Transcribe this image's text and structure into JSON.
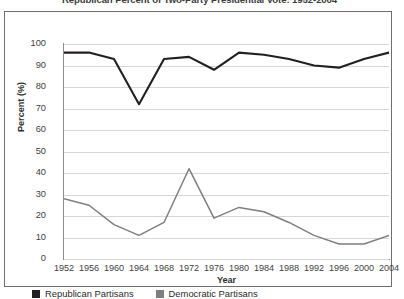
{
  "chart_data": {
    "type": "line",
    "title": "Republican Percent of Two-Party Presidential Vote: 1952-2004",
    "xlabel": "Year",
    "ylabel": "Percent (%)",
    "categories": [
      "1952",
      "1956",
      "1960",
      "1964",
      "1968",
      "1972",
      "1976",
      "1980",
      "1984",
      "1988",
      "1992",
      "1996",
      "2000",
      "2004"
    ],
    "x": [
      1952,
      1956,
      1960,
      1964,
      1968,
      1972,
      1976,
      1980,
      1984,
      1988,
      1992,
      1996,
      2000,
      2004
    ],
    "xlim": [
      1952,
      2004
    ],
    "ylim": [
      0,
      100
    ],
    "yticks": [
      0,
      10,
      20,
      30,
      40,
      50,
      60,
      70,
      80,
      90,
      100
    ],
    "grid": "horizontal",
    "legend_position": "below-axes-left",
    "series": [
      {
        "name": "Republican Partisans",
        "color": "#231f20",
        "values": [
          96,
          96,
          93,
          72,
          93,
          94,
          88,
          96,
          95,
          93,
          90,
          89,
          93,
          96
        ]
      },
      {
        "name": "Democratic Partisans",
        "color": "#7f7f7f",
        "values": [
          28,
          25,
          16,
          11,
          17,
          42,
          19,
          24,
          22,
          17,
          11,
          7,
          7,
          11
        ]
      }
    ]
  },
  "legend": {
    "items": [
      {
        "label": "Republican Partisans",
        "color": "#231f20"
      },
      {
        "label": "Democratic Partisans",
        "color": "#7f7f7f"
      }
    ]
  },
  "colors": {
    "republican": "#231f20",
    "democratic": "#7f7f7f",
    "gridline": "#d6d6d6",
    "axis": "#8d8d8d",
    "panel_border": "#6e6e6e",
    "text": "#3f3f3f"
  }
}
